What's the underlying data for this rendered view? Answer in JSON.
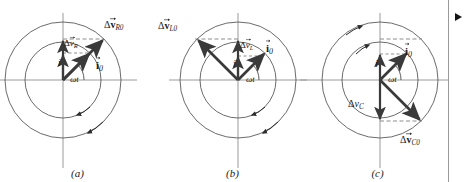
{
  "figure": {
    "type": "phasor-diagram-set",
    "background_color": "#ffffff",
    "stroke_color": "#3c3c3c",
    "axis_color": "#9a9a9a",
    "vector_color": "#3a3a3a",
    "dashed_color": "#8c8c8c",
    "text_color": "#1b1b1b",
    "edge_marker_color": "#161616",
    "panel_count": 3
  },
  "panels": [
    {
      "id": "a",
      "caption": "(a)",
      "element": "resistor",
      "center": {
        "x": 63,
        "y": 80
      },
      "inner_radius": 38,
      "outer_radius": 58,
      "phase_angle_deg": 45,
      "labels": {
        "current_phasor": {
          "symbol": "i",
          "subscript": "0",
          "bold": true,
          "has_vector_arrow": true,
          "x": 97,
          "y": 64
        },
        "current_instant": {
          "symbol": "i",
          "subscript": "",
          "bold": false,
          "has_vector_arrow": false,
          "x": 61,
          "y": 60
        },
        "angle": {
          "text": "ωt",
          "x": 72,
          "y": 78
        },
        "voltage_phasor": {
          "symbol": "v",
          "delta": true,
          "subscript": "R0",
          "bold": true,
          "has_vector_arrow": true,
          "x": 104,
          "y": 22
        },
        "voltage_instant": {
          "symbol": "v",
          "delta": true,
          "subscript": "R",
          "bold": false,
          "has_vector_arrow": true,
          "x": 66,
          "y": 41
        }
      },
      "vectors": [
        {
          "name": "current-phasor-arrow",
          "angle_deg": 45,
          "length_fraction": 1.0,
          "ring": "inner",
          "weight": "heavy"
        },
        {
          "name": "current-projection-arrow",
          "angle_deg": 90,
          "length_fraction": 0.7,
          "ring": "inner",
          "weight": "medium"
        },
        {
          "name": "voltage-phasor-arrow",
          "angle_deg": 45,
          "length_fraction": 1.0,
          "ring": "outer",
          "weight": "heavy"
        },
        {
          "name": "voltage-projection-arrow",
          "angle_deg": 90,
          "length_fraction": 1.0,
          "ring": "outer",
          "weight": "medium"
        }
      ],
      "rotation_markers": 2,
      "rotation_sense": "counterclockwise"
    },
    {
      "id": "b",
      "caption": "(b)",
      "element": "inductor",
      "center": {
        "x": 83,
        "y": 80
      },
      "inner_radius": 38,
      "outer_radius": 58,
      "phase_angle_deg": 45,
      "labels": {
        "current_phasor": {
          "symbol": "i",
          "subscript": "0",
          "bold": true,
          "has_vector_arrow": true,
          "x": 112,
          "y": 47
        },
        "current_instant": {
          "symbol": "i",
          "subscript": "",
          "bold": false,
          "has_vector_arrow": false,
          "x": 80,
          "y": 61
        },
        "angle": {
          "text": "ωt",
          "x": 94,
          "y": 78
        },
        "voltage_phasor": {
          "symbol": "v",
          "delta": true,
          "subscript": "L0",
          "bold": true,
          "has_vector_arrow": true,
          "x": 5,
          "y": 23
        },
        "voltage_instant": {
          "symbol": "v",
          "delta": true,
          "subscript": "L",
          "bold": false,
          "has_vector_arrow": true,
          "x": 86,
          "y": 42
        }
      },
      "vectors": [
        {
          "name": "current-phasor-arrow",
          "angle_deg": 45,
          "length_fraction": 1.0,
          "ring": "inner",
          "weight": "heavy"
        },
        {
          "name": "current-projection-arrow",
          "angle_deg": 90,
          "length_fraction": 0.62,
          "ring": "inner",
          "weight": "medium"
        },
        {
          "name": "voltage-phasor-arrow",
          "angle_deg": 135,
          "length_fraction": 1.0,
          "ring": "outer",
          "weight": "heavy"
        },
        {
          "name": "voltage-projection-arrow",
          "angle_deg": 90,
          "length_fraction": 1.0,
          "ring": "outer",
          "weight": "medium"
        }
      ],
      "rotation_markers": 2,
      "rotation_sense": "counterclockwise"
    },
    {
      "id": "c",
      "caption": "(c)",
      "element": "capacitor",
      "center": {
        "x": 80,
        "y": 80
      },
      "inner_radius": 38,
      "outer_radius": 58,
      "phase_angle_deg": 45,
      "labels": {
        "current_phasor": {
          "symbol": "i",
          "subscript": "0",
          "bold": true,
          "has_vector_arrow": true,
          "x": 106,
          "y": 50
        },
        "current_instant": {
          "symbol": "i",
          "subscript": "",
          "bold": false,
          "has_vector_arrow": false,
          "x": 78,
          "y": 61
        },
        "angle": {
          "text": "ωt",
          "x": 91,
          "y": 78
        },
        "voltage_phasor": {
          "symbol": "v",
          "delta": true,
          "subscript": "C0",
          "bold": true,
          "has_vector_arrow": true,
          "x": 100,
          "y": 137
        },
        "voltage_instant": {
          "symbol": "v",
          "delta": true,
          "subscript": "C",
          "bold": false,
          "has_vector_arrow": false,
          "x": 53,
          "y": 101
        }
      },
      "vectors": [
        {
          "name": "current-phasor-arrow",
          "angle_deg": 45,
          "length_fraction": 1.0,
          "ring": "inner",
          "weight": "heavy"
        },
        {
          "name": "current-projection-arrow",
          "angle_deg": 90,
          "length_fraction": 0.7,
          "ring": "inner",
          "weight": "medium"
        },
        {
          "name": "voltage-phasor-arrow",
          "angle_deg": -45,
          "length_fraction": 1.0,
          "ring": "outer",
          "weight": "heavy"
        },
        {
          "name": "voltage-projection-arrow",
          "angle_deg": -90,
          "length_fraction": 1.0,
          "ring": "outer",
          "weight": "medium"
        }
      ],
      "rotation_markers": 2,
      "rotation_sense": "counterclockwise"
    }
  ],
  "glyphs": {
    "delta": "Δ",
    "omega_t": "ωt",
    "vee": "v",
    "eye": "i"
  }
}
